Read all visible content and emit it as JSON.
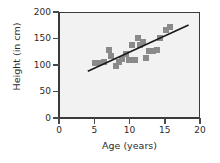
{
  "chart_data": {
    "type": "scatter",
    "title": "",
    "xlabel": "Age (years)",
    "ylabel": "Height (in cm)",
    "xlim": [
      0,
      20
    ],
    "ylim": [
      0,
      200
    ],
    "xticks": [
      0,
      5,
      10,
      15,
      20
    ],
    "yticks": [
      0,
      50,
      100,
      150,
      200
    ],
    "grid": false,
    "legend": null,
    "marker_color": "#8a8a8a",
    "marker_shape": "square",
    "plot_background": "#f2f2f2",
    "axis_color": "#3a3a3a",
    "trendline_color": "#1a1a1a",
    "series": [
      {
        "name": "Height vs Age",
        "x": [
          5.0,
          5.6,
          6.2,
          7.0,
          7.2,
          7.9,
          8.3,
          8.8,
          9.3,
          9.8,
          10.2,
          10.6,
          11.0,
          11.3,
          11.8,
          12.2,
          12.6,
          13.2,
          13.8,
          14.2,
          15.1,
          15.6
        ],
        "y": [
          105,
          105,
          108,
          130,
          119,
          100,
          108,
          113,
          122,
          112,
          140,
          112,
          153,
          140,
          145,
          116,
          128,
          128,
          130,
          152,
          168,
          173
        ]
      }
    ],
    "trendline": {
      "type": "linear",
      "x_start": 4.0,
      "y_start": 88,
      "x_end": 18.5,
      "y_end": 177
    }
  }
}
